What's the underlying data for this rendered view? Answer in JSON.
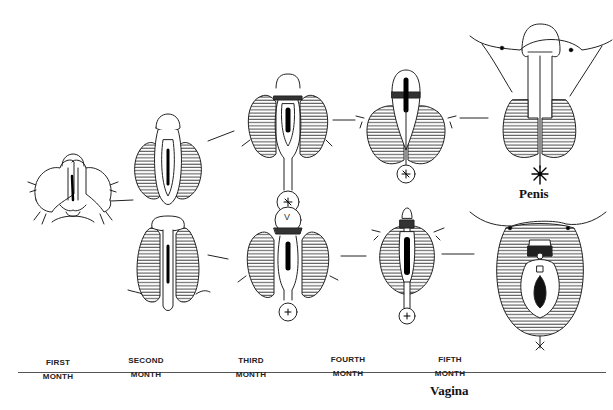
{
  "diagram": {
    "type": "developmental-stages",
    "rows": [
      {
        "name": "male-pathway",
        "end_label": "Penis"
      },
      {
        "name": "female-pathway",
        "end_label": "Vagina"
      }
    ],
    "stages": [
      {
        "top": "FIRST",
        "bottom": "MONTH"
      },
      {
        "top": "SECOND",
        "bottom": "MONTH"
      },
      {
        "top": "THIRD",
        "bottom": "MONTH"
      },
      {
        "top": "FOURTH",
        "bottom": "MONTH"
      },
      {
        "top": "FIFTH",
        "bottom": "MONTH"
      }
    ],
    "figure_annotation": "V",
    "colors": {
      "ink": "#222222",
      "background": "#ffffff",
      "hatch": "#444444"
    }
  }
}
